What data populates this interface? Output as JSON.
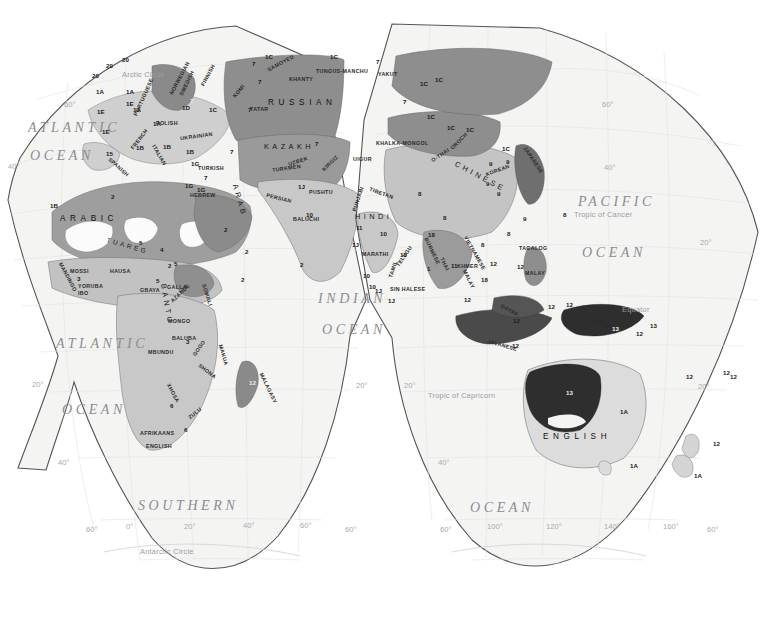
{
  "page": {
    "projection": "Goode homolosine interrupted",
    "hemisphere": "Eastern Hemisphere (Africa, Eurasia, Australia)",
    "top_rule_color": "#4a4a4a",
    "dot_color": "#3b3b3b"
  },
  "oceans": [
    {
      "name": "ATLANTIC",
      "x": 28,
      "y": 120,
      "size": "big"
    },
    {
      "name": "OCEAN",
      "x": 30,
      "y": 148,
      "size": "big"
    },
    {
      "name": "ATLANTIC",
      "x": 56,
      "y": 336,
      "size": "big"
    },
    {
      "name": "OCEAN",
      "x": 62,
      "y": 402,
      "size": "big"
    },
    {
      "name": "INDIAN",
      "x": 318,
      "y": 291,
      "size": "big"
    },
    {
      "name": "OCEAN",
      "x": 322,
      "y": 322,
      "size": "big"
    },
    {
      "name": "PACIFIC",
      "x": 578,
      "y": 194,
      "size": "big"
    },
    {
      "name": "OCEAN",
      "x": 582,
      "y": 245,
      "size": "big"
    },
    {
      "name": "SOUTHERN",
      "x": 138,
      "y": 498,
      "size": "big"
    },
    {
      "name": "OCEAN",
      "x": 470,
      "y": 500,
      "size": "big"
    }
  ],
  "reference_lines": [
    {
      "label": "Arctic Circle",
      "x": 122,
      "y": 70
    },
    {
      "label": "Tropic of Cancer",
      "x": 574,
      "y": 210
    },
    {
      "label": "Equator",
      "x": 622,
      "y": 305
    },
    {
      "label": "Tropic of Capricorn",
      "x": 428,
      "y": 391
    },
    {
      "label": "Antarctic Circle",
      "x": 140,
      "y": 547
    }
  ],
  "graticule_labels": [
    {
      "text": "60°",
      "x": 64,
      "y": 100
    },
    {
      "text": "40°",
      "x": 8,
      "y": 162
    },
    {
      "text": "20°",
      "x": 32,
      "y": 380
    },
    {
      "text": "40°",
      "x": 58,
      "y": 458
    },
    {
      "text": "60°",
      "x": 86,
      "y": 525
    },
    {
      "text": "0°",
      "x": 126,
      "y": 522
    },
    {
      "text": "20°",
      "x": 184,
      "y": 522
    },
    {
      "text": "40°",
      "x": 243,
      "y": 521
    },
    {
      "text": "60°",
      "x": 300,
      "y": 521
    },
    {
      "text": "60°",
      "x": 345,
      "y": 525
    },
    {
      "text": "20°",
      "x": 356,
      "y": 381
    },
    {
      "text": "20°",
      "x": 404,
      "y": 381
    },
    {
      "text": "40°",
      "x": 438,
      "y": 458
    },
    {
      "text": "60°",
      "x": 440,
      "y": 525
    },
    {
      "text": "100°",
      "x": 487,
      "y": 522
    },
    {
      "text": "120°",
      "x": 546,
      "y": 522
    },
    {
      "text": "140°",
      "x": 604,
      "y": 522
    },
    {
      "text": "160°",
      "x": 663,
      "y": 522
    },
    {
      "text": "60°",
      "x": 707,
      "y": 525
    },
    {
      "text": "40°",
      "x": 604,
      "y": 163
    },
    {
      "text": "20°",
      "x": 700,
      "y": 238
    },
    {
      "text": "20°",
      "x": 698,
      "y": 382
    },
    {
      "text": "60°",
      "x": 602,
      "y": 100
    }
  ],
  "language_labels": [
    {
      "t": "RUSSIAN",
      "x": 268,
      "y": 98,
      "cls": "sp3"
    },
    {
      "t": "KAZAKH",
      "x": 264,
      "y": 142,
      "cls": "sp2"
    },
    {
      "t": "CHINESE",
      "x": 452,
      "y": 172,
      "cls": "sp2",
      "rot": 28
    },
    {
      "t": "ARABIC",
      "x": 60,
      "y": 214,
      "cls": "sp3"
    },
    {
      "t": "ARAB",
      "x": 223,
      "y": 196,
      "cls": "sp2",
      "rot": 74
    },
    {
      "t": "BANTU",
      "x": 146,
      "y": 300,
      "cls": "sp2",
      "rot": 80
    },
    {
      "t": "ENGLISH",
      "x": 543,
      "y": 432,
      "cls": "sp3"
    },
    {
      "t": "HINDI",
      "x": 355,
      "y": 212,
      "cls": "sp2"
    },
    {
      "t": "TUAREG",
      "x": 106,
      "y": 242,
      "cls": "sp",
      "rot": 16
    },
    {
      "t": "YAKUT",
      "x": 378,
      "y": 71
    },
    {
      "t": "KHANTY",
      "x": 289,
      "y": 76
    },
    {
      "t": "SAMOYED",
      "x": 266,
      "y": 60,
      "rot": -28
    },
    {
      "t": "TUNGUS-MANCHU",
      "x": 316,
      "y": 68
    },
    {
      "t": "TATAR",
      "x": 250,
      "y": 106
    },
    {
      "t": "KOMI",
      "x": 231,
      "y": 88,
      "rot": -50
    },
    {
      "t": "UZBEK",
      "x": 288,
      "y": 158,
      "rot": -18
    },
    {
      "t": "UIGUR",
      "x": 353,
      "y": 156
    },
    {
      "t": "KHALKA-MONGOL",
      "x": 376,
      "y": 140
    },
    {
      "t": "TURKMEN",
      "x": 272,
      "y": 165,
      "rot": -8
    },
    {
      "t": "KIRGIZ",
      "x": 320,
      "y": 160,
      "rot": -44
    },
    {
      "t": "PERSIAN",
      "x": 266,
      "y": 195,
      "rot": 14
    },
    {
      "t": "PUSHTU",
      "x": 309,
      "y": 189
    },
    {
      "t": "BALUCHI",
      "x": 293,
      "y": 216
    },
    {
      "t": "PUNJABI",
      "x": 345,
      "y": 196,
      "rot": -72
    },
    {
      "t": "TIBETAN",
      "x": 369,
      "y": 190,
      "rot": 20
    },
    {
      "t": "MARATHI",
      "x": 362,
      "y": 251
    },
    {
      "t": "TELUGU",
      "x": 392,
      "y": 253,
      "rot": -56
    },
    {
      "t": "TAMIL",
      "x": 384,
      "y": 266,
      "rot": -72
    },
    {
      "t": "SIN HALESE",
      "x": 390,
      "y": 286
    },
    {
      "t": "KOREAN",
      "x": 485,
      "y": 167,
      "rot": -20
    },
    {
      "t": "JAPANESE",
      "x": 518,
      "y": 157,
      "rot": 56
    },
    {
      "t": "OROCH",
      "x": 448,
      "y": 138,
      "rot": -46
    },
    {
      "t": "O-THAI",
      "x": 430,
      "y": 152,
      "rot": -34
    },
    {
      "t": "TAGALOG",
      "x": 519,
      "y": 245
    },
    {
      "t": "MALAY",
      "x": 525,
      "y": 270
    },
    {
      "t": "MALAY",
      "x": 459,
      "y": 276,
      "rot": 64
    },
    {
      "t": "THAI",
      "x": 438,
      "y": 261,
      "rot": 62
    },
    {
      "t": "VIETNAMESE",
      "x": 456,
      "y": 250,
      "rot": 60
    },
    {
      "t": "BURMESE",
      "x": 418,
      "y": 248,
      "rot": 64
    },
    {
      "t": "KHMER",
      "x": 457,
      "y": 263
    },
    {
      "t": "DAYAK",
      "x": 500,
      "y": 307,
      "rot": 28
    },
    {
      "t": "JAVANESE",
      "x": 487,
      "y": 342,
      "rot": 16
    },
    {
      "t": "PAPUAN",
      "x": 594,
      "y": 321,
      "rot": 24
    },
    {
      "t": "MALAGASY",
      "x": 252,
      "y": 385,
      "rot": 64
    },
    {
      "t": "TURKISH",
      "x": 198,
      "y": 165
    },
    {
      "t": "HEBREW",
      "x": 190,
      "y": 192
    },
    {
      "t": "POLISH",
      "x": 156,
      "y": 120
    },
    {
      "t": "UKRAINIAN",
      "x": 180,
      "y": 133,
      "rot": -8
    },
    {
      "t": "FRENCH",
      "x": 127,
      "y": 136,
      "rot": -52
    },
    {
      "t": "ITALIAN",
      "x": 148,
      "y": 152,
      "rot": 60
    },
    {
      "t": "SPANISH",
      "x": 106,
      "y": 164,
      "rot": 42
    },
    {
      "t": "PORTUGUESE",
      "x": 123,
      "y": 94,
      "rot": -66
    },
    {
      "t": "NORWEGIAN",
      "x": 161,
      "y": 75,
      "rot": -62
    },
    {
      "t": "SWEDISH",
      "x": 173,
      "y": 80,
      "rot": -64
    },
    {
      "t": "FINNISH",
      "x": 196,
      "y": 72,
      "rot": -62
    },
    {
      "t": "MOSSI",
      "x": 70,
      "y": 268
    },
    {
      "t": "HAUSA",
      "x": 110,
      "y": 268
    },
    {
      "t": "YORUBA",
      "x": 78,
      "y": 283
    },
    {
      "t": "IBO",
      "x": 78,
      "y": 290
    },
    {
      "t": "GALLA",
      "x": 167,
      "y": 284
    },
    {
      "t": "GBAYA",
      "x": 140,
      "y": 287
    },
    {
      "t": "AZANDE",
      "x": 168,
      "y": 290,
      "rot": -44
    },
    {
      "t": "MANDINGO",
      "x": 52,
      "y": 274,
      "rot": 62
    },
    {
      "t": "SOMALI",
      "x": 196,
      "y": 292,
      "rot": 72
    },
    {
      "t": "MONGO",
      "x": 168,
      "y": 318
    },
    {
      "t": "BALUBA",
      "x": 172,
      "y": 335
    },
    {
      "t": "MBUNDU",
      "x": 148,
      "y": 349
    },
    {
      "t": "SHONA",
      "x": 197,
      "y": 368,
      "rot": 38
    },
    {
      "t": "MAKUA",
      "x": 213,
      "y": 352,
      "rot": 74
    },
    {
      "t": "GOGO",
      "x": 190,
      "y": 345,
      "rot": -56
    },
    {
      "t": "XHOSA",
      "x": 163,
      "y": 390,
      "rot": 62
    },
    {
      "t": "ZULU",
      "x": 187,
      "y": 410,
      "rot": -38
    },
    {
      "t": "AFRIKAANS",
      "x": 140,
      "y": 430
    },
    {
      "t": "ENGLISH",
      "x": 146,
      "y": 443
    }
  ],
  "numeric_labels": [
    {
      "t": "20",
      "x": 92,
      "y": 72
    },
    {
      "t": "20",
      "x": 106,
      "y": 62
    },
    {
      "t": "20",
      "x": 122,
      "y": 56
    },
    {
      "t": "1A",
      "x": 96,
      "y": 88
    },
    {
      "t": "1A",
      "x": 126,
      "y": 88
    },
    {
      "t": "1A",
      "x": 133,
      "y": 106
    },
    {
      "t": "1A",
      "x": 153,
      "y": 120
    },
    {
      "t": "1E",
      "x": 97,
      "y": 108
    },
    {
      "t": "1E",
      "x": 102,
      "y": 128
    },
    {
      "t": "1E",
      "x": 126,
      "y": 100
    },
    {
      "t": "1D",
      "x": 182,
      "y": 104
    },
    {
      "t": "1C",
      "x": 209,
      "y": 106
    },
    {
      "t": "1B",
      "x": 136,
      "y": 144
    },
    {
      "t": "1B",
      "x": 163,
      "y": 143
    },
    {
      "t": "1B",
      "x": 186,
      "y": 148
    },
    {
      "t": "1G",
      "x": 191,
      "y": 160
    },
    {
      "t": "1G",
      "x": 197,
      "y": 186
    },
    {
      "t": "1G",
      "x": 185,
      "y": 182
    },
    {
      "t": "15",
      "x": 106,
      "y": 150
    },
    {
      "t": "1B",
      "x": 50,
      "y": 202
    },
    {
      "t": "1C",
      "x": 265,
      "y": 53
    },
    {
      "t": "1C",
      "x": 330,
      "y": 53
    },
    {
      "t": "1C",
      "x": 420,
      "y": 80
    },
    {
      "t": "1C",
      "x": 435,
      "y": 76
    },
    {
      "t": "1C",
      "x": 427,
      "y": 113
    },
    {
      "t": "1C",
      "x": 447,
      "y": 124
    },
    {
      "t": "1C",
      "x": 466,
      "y": 126
    },
    {
      "t": "1C",
      "x": 502,
      "y": 145
    },
    {
      "t": "7",
      "x": 190,
      "y": 97,
      "w": true
    },
    {
      "t": "7",
      "x": 248,
      "y": 106
    },
    {
      "t": "7",
      "x": 252,
      "y": 60
    },
    {
      "t": "7",
      "x": 258,
      "y": 78
    },
    {
      "t": "7",
      "x": 230,
      "y": 148
    },
    {
      "t": "7",
      "x": 315,
      "y": 140
    },
    {
      "t": "7",
      "x": 376,
      "y": 58
    },
    {
      "t": "7",
      "x": 403,
      "y": 98
    },
    {
      "t": "7",
      "x": 204,
      "y": 174
    },
    {
      "t": "2",
      "x": 111,
      "y": 193
    },
    {
      "t": "2",
      "x": 224,
      "y": 226
    },
    {
      "t": "2",
      "x": 241,
      "y": 276
    },
    {
      "t": "2",
      "x": 300,
      "y": 261
    },
    {
      "t": "2",
      "x": 168,
      "y": 262
    },
    {
      "t": "2",
      "x": 245,
      "y": 248
    },
    {
      "t": "4",
      "x": 160,
      "y": 246
    },
    {
      "t": "5",
      "x": 174,
      "y": 260
    },
    {
      "t": "5",
      "x": 156,
      "y": 277
    },
    {
      "t": "5",
      "x": 139,
      "y": 239
    },
    {
      "t": "3",
      "x": 77,
      "y": 275
    },
    {
      "t": "3",
      "x": 186,
      "y": 338
    },
    {
      "t": "6",
      "x": 170,
      "y": 402
    },
    {
      "t": "6",
      "x": 184,
      "y": 426
    },
    {
      "t": "8",
      "x": 418,
      "y": 190
    },
    {
      "t": "8",
      "x": 443,
      "y": 214
    },
    {
      "t": "8",
      "x": 481,
      "y": 241
    },
    {
      "t": "8",
      "x": 507,
      "y": 230
    },
    {
      "t": "8",
      "x": 563,
      "y": 211
    },
    {
      "t": "9",
      "x": 489,
      "y": 160
    },
    {
      "t": "9",
      "x": 486,
      "y": 180
    },
    {
      "t": "9",
      "x": 497,
      "y": 190
    },
    {
      "t": "9",
      "x": 506,
      "y": 158
    },
    {
      "t": "9",
      "x": 523,
      "y": 215
    },
    {
      "t": "1",
      "x": 427,
      "y": 265
    },
    {
      "t": "1J",
      "x": 298,
      "y": 183
    },
    {
      "t": "1J",
      "x": 352,
      "y": 241
    },
    {
      "t": "1J",
      "x": 375,
      "y": 287
    },
    {
      "t": "1J",
      "x": 388,
      "y": 297
    },
    {
      "t": "10",
      "x": 306,
      "y": 211
    },
    {
      "t": "10",
      "x": 380,
      "y": 230
    },
    {
      "t": "10",
      "x": 400,
      "y": 251
    },
    {
      "t": "10",
      "x": 363,
      "y": 272
    },
    {
      "t": "10",
      "x": 369,
      "y": 283
    },
    {
      "t": "11",
      "x": 356,
      "y": 224
    },
    {
      "t": "11",
      "x": 451,
      "y": 262
    },
    {
      "t": "12",
      "x": 464,
      "y": 296
    },
    {
      "t": "12",
      "x": 490,
      "y": 260
    },
    {
      "t": "12",
      "x": 517,
      "y": 263
    },
    {
      "t": "12",
      "x": 513,
      "y": 317
    },
    {
      "t": "12",
      "x": 548,
      "y": 303
    },
    {
      "t": "12",
      "x": 566,
      "y": 301
    },
    {
      "t": "12",
      "x": 636,
      "y": 330
    },
    {
      "t": "12",
      "x": 686,
      "y": 373
    },
    {
      "t": "12",
      "x": 723,
      "y": 369
    },
    {
      "t": "12",
      "x": 730,
      "y": 373
    },
    {
      "t": "12",
      "x": 713,
      "y": 440
    },
    {
      "t": "12",
      "x": 512,
      "y": 342
    },
    {
      "t": "12",
      "x": 249,
      "y": 379,
      "w": true
    },
    {
      "t": "13",
      "x": 650,
      "y": 322
    },
    {
      "t": "13",
      "x": 612,
      "y": 325,
      "w": true
    },
    {
      "t": "13",
      "x": 566,
      "y": 389,
      "w": true
    },
    {
      "t": "18",
      "x": 481,
      "y": 276
    },
    {
      "t": "18",
      "x": 428,
      "y": 231
    },
    {
      "t": "1A",
      "x": 620,
      "y": 408
    },
    {
      "t": "1A",
      "x": 630,
      "y": 462
    },
    {
      "t": "1A",
      "x": 694,
      "y": 472
    }
  ],
  "colors": {
    "land_light": "#cfcfcf",
    "land_mid": "#a8a8a8",
    "land_dark": "#7e7e7e",
    "land_darkest": "#2e2e2e",
    "land_white": "#fbfbfb",
    "outline": "#5a5a5a",
    "graticule": "#e3e3e3",
    "page_bg": "#ffffff",
    "map_bg": "#f3f3f2"
  }
}
